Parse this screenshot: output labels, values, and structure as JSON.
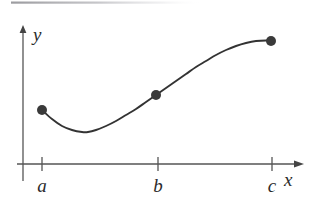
{
  "figure": {
    "background_color": "#ffffff",
    "curve_color": "#333333",
    "axis_color": "#555555",
    "point_color": "#3a3a3a",
    "scan_artifact_color": "#b8b8bc",
    "axes": {
      "x_label": "x",
      "y_label": "y",
      "x_axis_y_px": 164,
      "y_axis_x_px": 23,
      "x_axis_start_px": 17,
      "x_axis_end_px": 303,
      "y_axis_top_px": 26,
      "y_axis_bottom_px": 181
    },
    "ticks": [
      {
        "label": "a",
        "x_px": 42
      },
      {
        "label": "b",
        "x_px": 158
      },
      {
        "label": "c",
        "x_px": 272
      }
    ]
  },
  "chart_data": {
    "type": "line",
    "xlabel": "x",
    "ylabel": "y",
    "grid": false,
    "legend": null,
    "xlim": [
      17,
      303
    ],
    "ylim": [
      26,
      164
    ],
    "xtick_labels": [
      "a",
      "b",
      "c"
    ],
    "xtick_positions": [
      42,
      158,
      272
    ],
    "ytick_labels": [],
    "annotations": [],
    "series": [
      {
        "name": "curve",
        "kind": "smooth-curve",
        "color": "#333333",
        "x": [
          42,
          52,
          62,
          72,
          82,
          88,
          96,
          106,
          116,
          126,
          136,
          146,
          156,
          166,
          176,
          186,
          196,
          206,
          216,
          226,
          236,
          246,
          256,
          266,
          271
        ],
        "y": [
          110,
          119,
          126,
          130,
          132,
          132,
          130,
          126,
          121,
          115,
          109,
          102,
          95,
          88,
          81,
          74,
          67,
          61,
          55,
          50,
          46,
          43,
          41,
          40.5,
          41
        ]
      }
    ],
    "points": [
      {
        "label": "left-endpoint",
        "x": 42,
        "y": 110,
        "tick": "a"
      },
      {
        "label": "mid-point",
        "x": 156,
        "y": 95,
        "tick": "b"
      },
      {
        "label": "right-endpoint",
        "x": 271,
        "y": 41,
        "tick": "c"
      }
    ],
    "point_radius_px": 5
  }
}
